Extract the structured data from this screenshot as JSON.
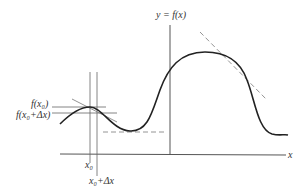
{
  "diagram": {
    "title": "",
    "type": "function graph with tangent lines",
    "labels": {
      "y_axis": "y = f(x)",
      "x_axis": "x",
      "f_x0": "f(x₀)",
      "f_x0_dx": "f(x₀+Δx)",
      "x0": "x₀",
      "x0_dx": "x₀+Δx"
    },
    "elements": [
      {
        "name": "curve",
        "description": "smooth function curve with local max near x0, local min, global max and falling tail"
      },
      {
        "name": "tangent-near-x0",
        "style": "solid"
      },
      {
        "name": "tangent-at-minimum",
        "style": "dashed"
      },
      {
        "name": "tangent-on-decreasing-slope",
        "style": "dashed"
      },
      {
        "name": "guide-lines",
        "description": "vertical lines at x0 and x0+dx, horizontal lines at f(x0) and f(x0+dx)"
      }
    ],
    "colors": {
      "curve": "#222222",
      "axes": "#555555",
      "guides": "#666666",
      "dashed": "#888888",
      "text": "#333333"
    }
  }
}
